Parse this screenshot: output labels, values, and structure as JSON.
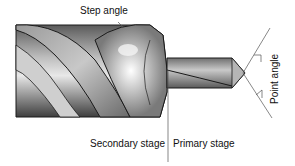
{
  "labels": {
    "step_angle": "Step angle",
    "secondary_stage": "Secondary stage",
    "primary_stage": "Primary stage",
    "point_angle": "Point angle"
  },
  "colors": {
    "background": "#ffffff",
    "outline": "#1a1a1a",
    "metal_dark": "#4a4a4a",
    "metal_mid": "#8c8c8c",
    "metal_light": "#e6e6e6",
    "annotation_line": "#555555",
    "text": "#111111"
  }
}
